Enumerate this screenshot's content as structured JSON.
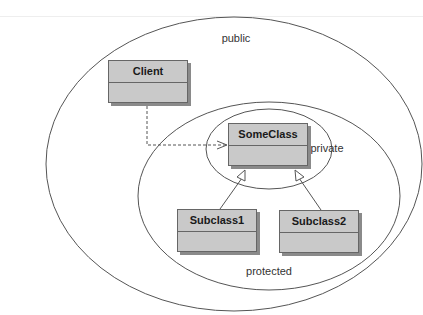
{
  "diagram": {
    "type": "UML visibility scopes",
    "scopes": [
      {
        "id": "public",
        "label": "public"
      },
      {
        "id": "protected",
        "label": "protected"
      },
      {
        "id": "private",
        "label": "private"
      }
    ],
    "classes": [
      {
        "id": "client",
        "name": "Client"
      },
      {
        "id": "someclass",
        "name": "SomeClass"
      },
      {
        "id": "subclass1",
        "name": "Subclass1"
      },
      {
        "id": "subclass2",
        "name": "Subclass2"
      }
    ],
    "relations": [
      {
        "from": "Client",
        "to": "SomeClass",
        "kind": "dependency (dashed, open arrow)"
      },
      {
        "from": "Subclass1",
        "to": "SomeClass",
        "kind": "generalization"
      },
      {
        "from": "Subclass2",
        "to": "SomeClass",
        "kind": "generalization"
      }
    ],
    "colors": {
      "class_fill": "#c9c9c9",
      "class_border": "#666666",
      "shadow": "#8a8a8a",
      "ellipse_stroke": "#555555",
      "text": "#333333"
    }
  }
}
